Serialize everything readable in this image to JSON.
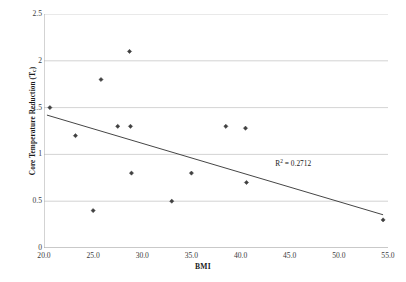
{
  "chart_data": {
    "type": "scatter",
    "title": "",
    "xlabel": "BMI",
    "ylabel": "Core Temperature Reduction (T",
    "ylabel_sub": "c",
    "ylabel_suffix": ")",
    "xlim": [
      20.0,
      55.0
    ],
    "ylim": [
      0,
      2.5
    ],
    "xticks": [
      "20.0",
      "25.0",
      "30.0",
      "35.0",
      "40.0",
      "45.0",
      "50.0",
      "55.0"
    ],
    "xtick_values": [
      20.0,
      25.0,
      30.0,
      35.0,
      40.0,
      45.0,
      50.0,
      55.0
    ],
    "yticks": [
      "0",
      "0.5",
      "1",
      "1.5",
      "2",
      "2.5"
    ],
    "ytick_values": [
      0,
      0.5,
      1,
      1.5,
      2,
      2.5
    ],
    "grid": "horizontal",
    "legend": "none",
    "marker": "diamond",
    "marker_color": "#404040",
    "x": [
      20.6,
      23.2,
      25.0,
      25.8,
      27.5,
      28.7,
      28.8,
      28.9,
      33.0,
      35.0,
      38.5,
      40.5,
      40.6,
      54.5
    ],
    "y": [
      1.5,
      1.2,
      0.4,
      1.8,
      1.3,
      2.1,
      1.3,
      0.8,
      0.5,
      0.8,
      1.3,
      1.28,
      0.7,
      0.3
    ],
    "points": [
      {
        "x": 20.6,
        "y": 1.5
      },
      {
        "x": 23.2,
        "y": 1.2
      },
      {
        "x": 25.0,
        "y": 0.4
      },
      {
        "x": 25.8,
        "y": 1.8
      },
      {
        "x": 27.5,
        "y": 1.3
      },
      {
        "x": 28.7,
        "y": 2.1
      },
      {
        "x": 28.8,
        "y": 1.3
      },
      {
        "x": 28.9,
        "y": 0.8
      },
      {
        "x": 33.0,
        "y": 0.5
      },
      {
        "x": 35.0,
        "y": 0.8
      },
      {
        "x": 38.5,
        "y": 1.3
      },
      {
        "x": 40.5,
        "y": 1.28
      },
      {
        "x": 40.6,
        "y": 0.7
      },
      {
        "x": 54.5,
        "y": 0.3
      }
    ],
    "trendline": {
      "type": "linear",
      "x_start": 20.3,
      "y_start": 1.42,
      "x_end": 54.5,
      "y_end": 0.355,
      "color": "#303030"
    },
    "annotations": [
      {
        "text_prefix": "R",
        "text_sup": "2",
        "text_suffix": " = 0.2712",
        "full_text": "R² = 0.2712",
        "x": 47.0,
        "y": 0.91
      }
    ]
  },
  "axis": {
    "x_title": "BMI",
    "y_title_main": "Core Temperature Reduction (T",
    "y_title_sub": "c",
    "y_title_end": ")"
  },
  "r2": {
    "label": "R",
    "exponent": "2",
    "value": " = 0.2712"
  },
  "colors": {
    "marker": "#404040",
    "trendline": "#303030",
    "gridline": "#c8c8c8",
    "axis": "#a8a8a8",
    "text": "#1a1a1a",
    "background": "#ffffff"
  }
}
